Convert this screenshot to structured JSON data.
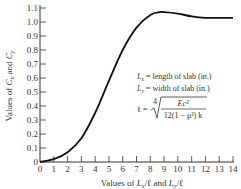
{
  "chart_data": {
    "type": "line",
    "title": "",
    "xlabel": "Values of Lx/ℓ and Ly/ℓ",
    "ylabel": "Values of Cx and Cy",
    "xlim": [
      0,
      14
    ],
    "ylim": [
      0,
      1.1
    ],
    "grid": false,
    "legend": null,
    "x_ticks": [
      0,
      1,
      2,
      3,
      4,
      5,
      6,
      7,
      8,
      9,
      10,
      11,
      12,
      13,
      14
    ],
    "y_ticks": [
      0,
      0.1,
      0.2,
      0.3,
      0.4,
      0.5,
      0.6,
      0.7,
      0.8,
      0.9,
      1.0,
      1.1
    ],
    "y_tick_labels": [
      "0",
      "0.1",
      "0.2",
      "0.3",
      "0.4",
      "0.5",
      "0.6",
      "0.7",
      "0.8",
      "0.9",
      "1.0",
      "1.1"
    ],
    "series": [
      {
        "name": "Cx, Cy",
        "x": [
          0,
          1,
          2,
          3,
          4,
          5,
          6,
          7,
          8,
          8.7,
          9,
          10,
          11,
          12,
          13,
          14
        ],
        "y": [
          0,
          0.02,
          0.07,
          0.17,
          0.35,
          0.58,
          0.8,
          0.96,
          1.05,
          1.07,
          1.07,
          1.06,
          1.04,
          1.03,
          1.03,
          1.03
        ]
      }
    ],
    "annotations": [
      "Lx = length of slab (in.)",
      "Ly = width of slab (in.)",
      "ℓ = ⁴√( Ec³ / 12(1 − μ²) k )"
    ]
  },
  "labels": {
    "xlabel_pre": "Values of ",
    "xlabel_lx": "L",
    "xlabel_lx_sub": "x",
    "xlabel_mid": "/ℓ and ",
    "xlabel_ly": "L",
    "xlabel_ly_sub": "y",
    "xlabel_post": "/ℓ",
    "ylabel": "Values of Cx and Cy",
    "ann_lx": "= length of slab (in.)",
    "ann_ly": "= width of slab (in.)",
    "ann_l": "ℓ =",
    "ann_num": "Ec³",
    "ann_den": "12(1 − μ²) k",
    "ann_root": "4"
  }
}
